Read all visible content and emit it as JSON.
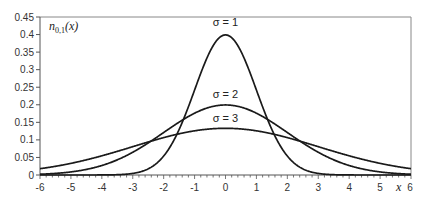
{
  "chart_data": {
    "type": "line",
    "title": "",
    "ylabel_inset": "n0,1(x)",
    "ylabel_parts": {
      "base": "n",
      "sub": "0,1",
      "arg": "(x)"
    },
    "xlabel": "x",
    "xlim": [
      -6,
      6
    ],
    "ylim": [
      0,
      0.45
    ],
    "x_ticks": [
      -6,
      -5,
      -4,
      -3,
      -2,
      -1,
      0,
      1,
      2,
      3,
      4,
      5,
      6
    ],
    "x_tick_labels": [
      "-6",
      "-5",
      "-4",
      "-3",
      "-2",
      "-1",
      "0",
      "1",
      "2",
      "3",
      "4",
      "5",
      "6"
    ],
    "y_ticks": [
      0,
      0.05,
      0.1,
      0.15,
      0.2,
      0.25,
      0.3,
      0.35,
      0.4,
      0.45
    ],
    "y_tick_labels": [
      "0",
      "0.05",
      "0.1",
      "0.15",
      "0.2",
      "0.25",
      "0.3",
      "0.35",
      "0.4",
      "0.45"
    ],
    "grid": false,
    "legend": "none (inline annotations above each curve)",
    "series": [
      {
        "name": "σ = 1",
        "mu": 0,
        "sigma": 1,
        "peak": 0.399,
        "x": [
          -6,
          -4,
          -3,
          -2,
          -1,
          0,
          1,
          2,
          3,
          4,
          6
        ],
        "values": [
          0.0,
          0.0001,
          0.0044,
          0.054,
          0.242,
          0.399,
          0.242,
          0.054,
          0.0044,
          0.0001,
          0.0
        ]
      },
      {
        "name": "σ = 2",
        "mu": 0,
        "sigma": 2,
        "peak": 0.199,
        "x": [
          -6,
          -4,
          -3,
          -2,
          -1,
          0,
          1,
          2,
          3,
          4,
          6
        ],
        "values": [
          0.0022,
          0.027,
          0.065,
          0.121,
          0.176,
          0.199,
          0.176,
          0.121,
          0.065,
          0.027,
          0.0022
        ]
      },
      {
        "name": "σ = 3",
        "mu": 0,
        "sigma": 3,
        "peak": 0.133,
        "x": [
          -6,
          -4,
          -3,
          -2,
          -1,
          0,
          1,
          2,
          3,
          4,
          6
        ],
        "values": [
          0.018,
          0.055,
          0.081,
          0.106,
          0.126,
          0.133,
          0.126,
          0.106,
          0.081,
          0.055,
          0.018
        ]
      }
    ],
    "annotations": [
      {
        "text": "σ = 1",
        "x": 0,
        "y": 0.425
      },
      {
        "text": "σ = 2",
        "x": 0,
        "y": 0.22
      },
      {
        "text": "σ = 3",
        "x": 0,
        "y": 0.152
      }
    ]
  },
  "style": {
    "curve_color": "#1a1a1a",
    "axis_color": "#555555",
    "frame_color": "#888888"
  }
}
